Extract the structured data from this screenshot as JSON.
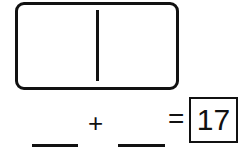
{
  "worksheet": {
    "domino": {
      "left_pips": 0,
      "right_pips": 0
    },
    "equation": {
      "addend1": "",
      "operator": "+",
      "addend2": "",
      "equals": "=",
      "sum": "17"
    }
  }
}
